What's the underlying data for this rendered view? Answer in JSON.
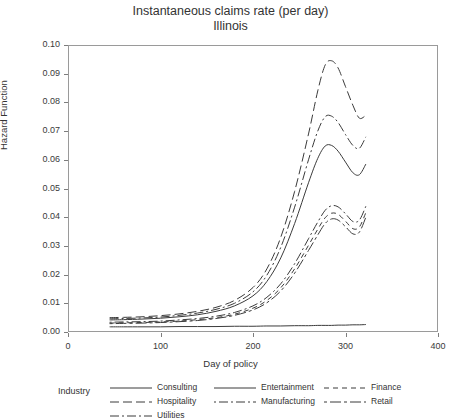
{
  "chart_data": {
    "type": "line",
    "title": "Instantaneous claims rate (per day)",
    "subtitle": "Illinois",
    "xlabel": "Day of policy",
    "ylabel": "Hazard Function",
    "xlim": [
      0,
      400
    ],
    "ylim": [
      0.0,
      0.1
    ],
    "xticks": [
      "0",
      "100",
      "200",
      "300",
      "400"
    ],
    "yticks": [
      "0.00",
      "0.01",
      "0.02",
      "0.03",
      "0.04",
      "0.05",
      "0.06",
      "0.07",
      "0.08",
      "0.09",
      "0.10"
    ],
    "grid": false,
    "legend_position": "bottom",
    "legend_title": "Industry",
    "x": [
      45,
      60,
      80,
      100,
      120,
      140,
      160,
      180,
      200,
      215,
      230,
      245,
      260,
      270,
      278,
      285,
      292,
      300,
      308,
      315,
      322
    ],
    "series": [
      {
        "name": "Consulting",
        "dash": "solid",
        "values": [
          0.0018,
          0.0018,
          0.0018,
          0.0018,
          0.0019,
          0.0019,
          0.0019,
          0.002,
          0.002,
          0.0021,
          0.0021,
          0.0022,
          0.0022,
          0.0023,
          0.0023,
          0.0023,
          0.0024,
          0.0024,
          0.0025,
          0.0025,
          0.0026
        ]
      },
      {
        "name": "Hospitality",
        "dash": "long-dash",
        "values": [
          0.005,
          0.0051,
          0.0053,
          0.0057,
          0.0063,
          0.0072,
          0.0086,
          0.011,
          0.0155,
          0.022,
          0.033,
          0.049,
          0.069,
          0.084,
          0.093,
          0.0945,
          0.092,
          0.0855,
          0.079,
          0.0745,
          0.0755
        ]
      },
      {
        "name": "Utilities",
        "dash": "dash-dot",
        "values": [
          0.0046,
          0.0047,
          0.0049,
          0.0052,
          0.0058,
          0.0066,
          0.0079,
          0.01,
          0.014,
          0.0198,
          0.0295,
          0.0435,
          0.06,
          0.07,
          0.075,
          0.0752,
          0.073,
          0.0688,
          0.065,
          0.064,
          0.068
        ]
      },
      {
        "name": "Entertainment",
        "dash": "solid",
        "values": [
          0.0042,
          0.0043,
          0.0045,
          0.0048,
          0.0053,
          0.006,
          0.0072,
          0.0091,
          0.0126,
          0.0176,
          0.0258,
          0.0378,
          0.052,
          0.0605,
          0.0648,
          0.065,
          0.063,
          0.0592,
          0.0555,
          0.0548,
          0.0585
        ]
      },
      {
        "name": "Manufacturing",
        "dash": "dot-dash",
        "values": [
          0.0034,
          0.0035,
          0.0036,
          0.0038,
          0.0042,
          0.0047,
          0.0055,
          0.0068,
          0.0091,
          0.0121,
          0.0168,
          0.0238,
          0.0325,
          0.0383,
          0.0424,
          0.044,
          0.0436,
          0.0412,
          0.0385,
          0.039,
          0.0438
        ]
      },
      {
        "name": "Finance",
        "dash": "short-dash",
        "values": [
          0.0031,
          0.0032,
          0.0033,
          0.0035,
          0.0038,
          0.0043,
          0.005,
          0.0062,
          0.0083,
          0.011,
          0.0154,
          0.022,
          0.0302,
          0.0358,
          0.0398,
          0.0414,
          0.041,
          0.0386,
          0.036,
          0.0366,
          0.0416
        ]
      },
      {
        "name": "Retail",
        "dash": "dash-line",
        "values": [
          0.0029,
          0.003,
          0.0031,
          0.0033,
          0.0036,
          0.004,
          0.0047,
          0.0058,
          0.0077,
          0.0102,
          0.0143,
          0.0205,
          0.0284,
          0.0338,
          0.0378,
          0.0394,
          0.039,
          0.0367,
          0.0342,
          0.0348,
          0.04
        ]
      }
    ]
  }
}
